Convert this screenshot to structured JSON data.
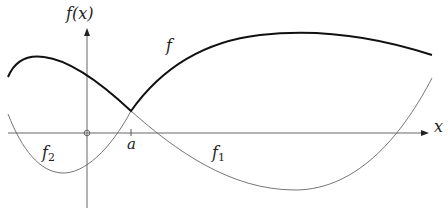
{
  "diagram": {
    "type": "function-plot",
    "axes": {
      "x_label": "x",
      "y_label": "f(x)",
      "origin_marker": "circle",
      "tick_label": "a"
    },
    "curves": [
      {
        "name": "f",
        "style": "thick",
        "description": "upper envelope max(f1, f2)"
      },
      {
        "name": "f1",
        "label": "f",
        "subscript": "1",
        "style": "thin"
      },
      {
        "name": "f2",
        "label": "f",
        "subscript": "2",
        "style": "thin"
      }
    ],
    "labels": {
      "f": "f",
      "f1_base": "f",
      "f1_sub": "1",
      "f2_base": "f",
      "f2_sub": "2",
      "a": "a",
      "x": "x",
      "fx": "f(x)"
    },
    "colors": {
      "axis": "#555555",
      "thick_curve": "#111111",
      "thin_curve": "#666666"
    }
  }
}
